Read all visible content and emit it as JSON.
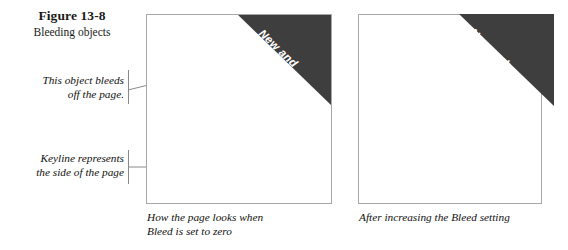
{
  "figure": {
    "number": "Figure 13-8",
    "subtitle": "Bleeding objects"
  },
  "callouts": [
    {
      "name": "object-bleeds",
      "line1": "This object bleeds",
      "line2": "off the page."
    },
    {
      "name": "keyline",
      "line1": "Keyline represents",
      "line2": "the side of the page"
    }
  ],
  "panels": [
    {
      "id": "left",
      "banner": {
        "line1": "New and",
        "line2": "Improved"
      },
      "caption": {
        "line1": "How the page looks when",
        "line2": "Bleed is set to zero"
      }
    },
    {
      "id": "right",
      "banner": {
        "line1": "New and",
        "line2": "Improved"
      },
      "caption": {
        "line1": "After increasing the Bleed setting",
        "line2": ""
      }
    }
  ],
  "colors": {
    "banner_fill": "#3f3e3e",
    "banner_text": "#ffffff",
    "keyline": "#a8a8a8",
    "leader_line": "#8a8a8a",
    "body_text": "#111111",
    "page_background": "#ffffff"
  }
}
